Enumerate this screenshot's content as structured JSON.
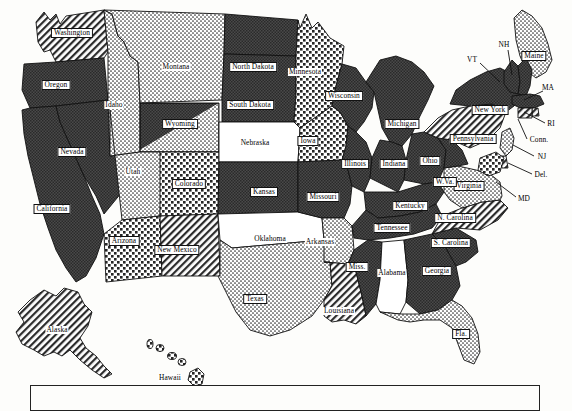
{
  "map": {
    "title": "United States Choropleth Map",
    "legend_box": {
      "visible": true,
      "entries": []
    },
    "pattern_names": {
      "dark": "solid-dark-fill",
      "hatch": "diagonal-hatch-fill",
      "fine_dots": "fine-stipple-fill",
      "coarse_dots": "coarse-dot-fill",
      "blank": "white-blank-fill",
      "split": "split-dark-and-stipple-fill"
    },
    "states": [
      {
        "code": "WA",
        "label": "Washington",
        "fill": "hatch",
        "x": 72,
        "y": 33,
        "chip": true
      },
      {
        "code": "OR",
        "label": "Oregon",
        "fill": "dark",
        "x": 56,
        "y": 85,
        "chip": true
      },
      {
        "code": "CA",
        "label": "California",
        "fill": "dark",
        "x": 52,
        "y": 209,
        "chip": true
      },
      {
        "code": "NV",
        "label": "Nevada",
        "fill": "dark",
        "x": 72,
        "y": 152,
        "chip": true
      },
      {
        "code": "ID",
        "label": "Idaho",
        "fill": "fine_dots",
        "x": 114,
        "y": 105,
        "chip": false
      },
      {
        "code": "MT",
        "label": "Montana",
        "fill": "fine_dots",
        "x": 176,
        "y": 67,
        "chip": false
      },
      {
        "code": "WY",
        "label": "Wyoming",
        "fill": "split",
        "x": 180,
        "y": 124,
        "chip": true
      },
      {
        "code": "UT",
        "label": "Utah",
        "fill": "fine_dots",
        "x": 133,
        "y": 172,
        "chip": false
      },
      {
        "code": "CO",
        "label": "Colorado",
        "fill": "coarse_dots",
        "x": 189,
        "y": 184,
        "chip": true
      },
      {
        "code": "AZ",
        "label": "Arizona",
        "fill": "coarse_dots",
        "x": 124,
        "y": 241,
        "chip": true
      },
      {
        "code": "NM",
        "label": "New Mexico",
        "fill": "hatch",
        "x": 177,
        "y": 250,
        "chip": true
      },
      {
        "code": "ND",
        "label": "North Dakota",
        "fill": "dark",
        "x": 253,
        "y": 67,
        "chip": true
      },
      {
        "code": "SD",
        "label": "South Dakota",
        "fill": "dark",
        "x": 250,
        "y": 105,
        "chip": true
      },
      {
        "code": "NE",
        "label": "Nebraska",
        "fill": "blank",
        "x": 255,
        "y": 143,
        "chip": false
      },
      {
        "code": "KS",
        "label": "Kansas",
        "fill": "dark",
        "x": 264,
        "y": 192,
        "chip": true
      },
      {
        "code": "OK",
        "label": "Oklahoma",
        "fill": "blank",
        "x": 270,
        "y": 239,
        "chip": false
      },
      {
        "code": "TX",
        "label": "Texas",
        "fill": "fine_dots",
        "x": 255,
        "y": 299,
        "chip": true
      },
      {
        "code": "MN",
        "label": "Minnesota",
        "fill": "coarse_dots",
        "x": 305,
        "y": 72,
        "chip": false
      },
      {
        "code": "IA",
        "label": "Iowa",
        "fill": "coarse_dots",
        "x": 308,
        "y": 141,
        "chip": true
      },
      {
        "code": "MO",
        "label": "Missouri",
        "fill": "dark",
        "x": 323,
        "y": 197,
        "chip": true
      },
      {
        "code": "AR",
        "label": "Arkansas",
        "fill": "fine_dots",
        "x": 320,
        "y": 242,
        "chip": false
      },
      {
        "code": "LA",
        "label": "Louisiana",
        "fill": "hatch",
        "x": 339,
        "y": 311,
        "chip": false
      },
      {
        "code": "WI",
        "label": "Wisconsin",
        "fill": "dark",
        "x": 344,
        "y": 96,
        "chip": true
      },
      {
        "code": "IL",
        "label": "Illinois",
        "fill": "dark",
        "x": 355,
        "y": 164,
        "chip": true
      },
      {
        "code": "MS",
        "label": "Miss.",
        "fill": "dark",
        "x": 357,
        "y": 267,
        "chip": true
      },
      {
        "code": "MI",
        "label": "Michigan",
        "fill": "dark",
        "x": 402,
        "y": 124,
        "chip": true
      },
      {
        "code": "IN",
        "label": "Indiana",
        "fill": "dark",
        "x": 394,
        "y": 164,
        "chip": true
      },
      {
        "code": "OH",
        "label": "Ohio",
        "fill": "dark",
        "x": 430,
        "y": 161,
        "chip": true
      },
      {
        "code": "KY",
        "label": "Kentucky",
        "fill": "dark",
        "x": 410,
        "y": 206,
        "chip": true
      },
      {
        "code": "TN",
        "label": "Tennessee",
        "fill": "dark",
        "x": 392,
        "y": 228,
        "chip": true
      },
      {
        "code": "AL",
        "label": "Alabama",
        "fill": "blank",
        "x": 392,
        "y": 273,
        "chip": false
      },
      {
        "code": "GA",
        "label": "Georgia",
        "fill": "dark",
        "x": 437,
        "y": 271,
        "chip": true
      },
      {
        "code": "FL",
        "label": "Fla.",
        "fill": "fine_dots",
        "x": 461,
        "y": 334,
        "chip": true
      },
      {
        "code": "SC",
        "label": "S. Carolina",
        "fill": "dark",
        "x": 451,
        "y": 243,
        "chip": true
      },
      {
        "code": "NC",
        "label": "N. Carolina",
        "fill": "hatch",
        "x": 455,
        "y": 218,
        "chip": true
      },
      {
        "code": "VA",
        "label": "Virginia",
        "fill": "fine_dots",
        "x": 469,
        "y": 186,
        "chip": true
      },
      {
        "code": "WV",
        "label": "W.Va.",
        "fill": "dark",
        "x": 445,
        "y": 182,
        "chip": true
      },
      {
        "code": "PA",
        "label": "Pennsylvania",
        "fill": "hatch",
        "x": 473,
        "y": 139,
        "chip": true
      },
      {
        "code": "NY",
        "label": "New York",
        "fill": "dark",
        "x": 490,
        "y": 110,
        "chip": true
      },
      {
        "code": "ME",
        "label": "Maine",
        "fill": "fine_dots",
        "x": 534,
        "y": 56,
        "chip": true
      }
    ],
    "callout_labels": [
      {
        "code": "VT",
        "label": "VT",
        "x": 472,
        "y": 60,
        "lx1": 480,
        "ly1": 63,
        "lx2": 500,
        "ly2": 82
      },
      {
        "code": "NH",
        "label": "NH",
        "x": 504,
        "y": 45,
        "lx1": 508,
        "ly1": 50,
        "lx2": 512,
        "ly2": 75
      },
      {
        "code": "MA",
        "label": "MA",
        "x": 548,
        "y": 88,
        "lx1": 543,
        "ly1": 91,
        "lx2": 524,
        "ly2": 100
      },
      {
        "code": "RI",
        "label": "RI",
        "x": 551,
        "y": 124,
        "lx1": 545,
        "ly1": 123,
        "lx2": 524,
        "ly2": 112
      },
      {
        "code": "CT",
        "label": "Conn.",
        "x": 539,
        "y": 140,
        "lx1": 527,
        "ly1": 139,
        "lx2": 518,
        "ly2": 119
      },
      {
        "code": "NJ",
        "label": "NJ",
        "x": 542,
        "y": 157,
        "lx1": 534,
        "ly1": 156,
        "lx2": 513,
        "ly2": 145
      },
      {
        "code": "DE",
        "label": "Del.",
        "x": 541,
        "y": 175,
        "lx1": 532,
        "ly1": 174,
        "lx2": 508,
        "ly2": 163
      },
      {
        "code": "MD",
        "label": "MD",
        "x": 524,
        "y": 199,
        "lx1": 516,
        "ly1": 197,
        "lx2": 496,
        "ly2": 182
      }
    ],
    "inset_states": [
      {
        "code": "AK",
        "label": "Alaska",
        "fill": "hatch",
        "x": 57,
        "y": 330
      },
      {
        "code": "HI",
        "label": "Hawaii",
        "fill": "coarse_dots",
        "x": 170,
        "y": 378
      }
    ]
  }
}
